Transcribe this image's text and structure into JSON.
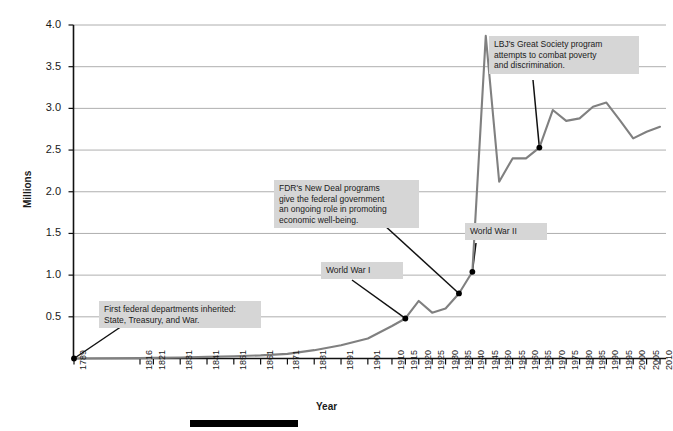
{
  "chart_data": {
    "type": "line",
    "title": "",
    "xlabel": "Year",
    "ylabel": "Millions",
    "ylim": [
      0,
      4.0
    ],
    "yticks": [
      0.5,
      1.0,
      1.5,
      2.0,
      2.5,
      3.0,
      3.5,
      4.0
    ],
    "ytick_labels": [
      "0.5",
      "1.0",
      "1.5",
      "2.0",
      "2.5",
      "3.0",
      "3.5",
      "4.0"
    ],
    "grid": true,
    "legend": "none",
    "line_color": "#808080",
    "marker_color": "#000000",
    "categories": [
      "1789",
      "1816",
      "1821",
      "1831",
      "1841",
      "1851",
      "1861",
      "1871",
      "1881",
      "1891",
      "1901",
      "1910",
      "1915",
      "1920",
      "1925",
      "1930",
      "1935",
      "1940",
      "1945",
      "1950",
      "1955",
      "1960",
      "1965",
      "1970",
      "1975",
      "1980",
      "1985",
      "1990",
      "1995",
      "2000",
      "2005",
      "2010"
    ],
    "values": [
      0.0,
      0.005,
      0.007,
      0.012,
      0.019,
      0.027,
      0.037,
      0.055,
      0.1,
      0.16,
      0.24,
      0.39,
      0.48,
      0.69,
      0.55,
      0.6,
      0.78,
      1.04,
      3.87,
      2.12,
      2.4,
      2.4,
      2.53,
      2.98,
      2.85,
      2.88,
      3.02,
      3.07,
      2.86,
      2.64,
      2.72,
      2.78
    ],
    "annotations": [
      {
        "id": "first-federal-departments",
        "text": "First federal departments inherited:\nState, Treasury, and War.",
        "points_to_year": "1789",
        "points_to_value": 0.0
      },
      {
        "id": "world-war-i",
        "text": "World War I",
        "points_to_year": "1915",
        "points_to_value": 0.48
      },
      {
        "id": "fdr-new-deal",
        "text": "FDR's New Deal programs\ngive the federal government\nan ongoing role in promoting\neconomic well-being.",
        "points_to_year": "1935",
        "points_to_value": 0.78
      },
      {
        "id": "world-war-ii",
        "text": "World War II",
        "points_to_year": "1940",
        "points_to_value": 1.04
      },
      {
        "id": "lbj-great-society",
        "text": "LBJ's Great Society program\nattempts to combat poverty\nand discrimination.",
        "points_to_year": "1965",
        "points_to_value": 2.53
      }
    ]
  }
}
